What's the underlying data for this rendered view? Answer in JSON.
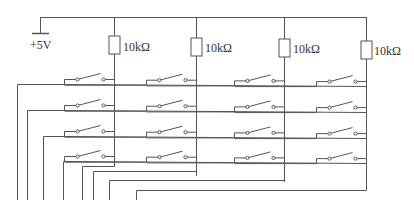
{
  "diagram": {
    "type": "4x4 matrix keypad circuit with pull-up resistors",
    "supply_label": "+5V",
    "resistors": [
      {
        "label": "10kΩ",
        "x": 114
      },
      {
        "label": "10kΩ",
        "x": 196
      },
      {
        "label": "10kΩ",
        "x": 284
      },
      {
        "label": "10kΩ",
        "x": 366
      }
    ],
    "rows": 4,
    "columns": 4,
    "line_color": "#555555"
  }
}
